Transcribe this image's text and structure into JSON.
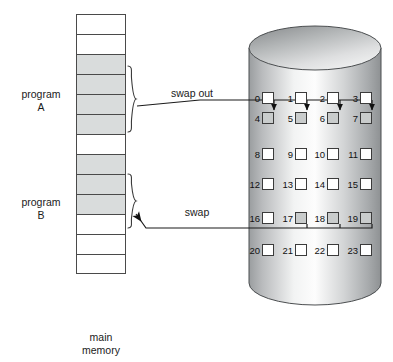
{
  "figure": {
    "title_alt": "swapping between main memory and disk",
    "main_memory_caption_line1": "main",
    "main_memory_caption_line2": "memory"
  },
  "labels": {
    "program_a_line1": "program",
    "program_a_line2": "A",
    "program_b_line1": "program",
    "program_b_line2": "B",
    "swap_out": "swap out",
    "swap_in": "swap"
  },
  "main_memory": {
    "row_count": 13,
    "rows": [
      {
        "index": 0,
        "state": "free"
      },
      {
        "index": 1,
        "state": "free"
      },
      {
        "index": 2,
        "state": "program-a"
      },
      {
        "index": 3,
        "state": "program-a"
      },
      {
        "index": 4,
        "state": "program-a"
      },
      {
        "index": 5,
        "state": "program-a"
      },
      {
        "index": 6,
        "state": "free"
      },
      {
        "index": 7,
        "state": "program-b"
      },
      {
        "index": 8,
        "state": "program-b"
      },
      {
        "index": 9,
        "state": "program-b"
      },
      {
        "index": 10,
        "state": "free"
      },
      {
        "index": 11,
        "state": "free"
      },
      {
        "index": 12,
        "state": "free"
      }
    ]
  },
  "disk": {
    "shape": "cylinder",
    "columns": 4,
    "rows": 6,
    "blocks": [
      {
        "id": 0,
        "label": "0",
        "occupied": false
      },
      {
        "id": 1,
        "label": "1",
        "occupied": false
      },
      {
        "id": 2,
        "label": "2",
        "occupied": false
      },
      {
        "id": 3,
        "label": "3",
        "occupied": false
      },
      {
        "id": 4,
        "label": "4",
        "occupied": true
      },
      {
        "id": 5,
        "label": "5",
        "occupied": true
      },
      {
        "id": 6,
        "label": "6",
        "occupied": true
      },
      {
        "id": 7,
        "label": "7",
        "occupied": true
      },
      {
        "id": 8,
        "label": "8",
        "occupied": false
      },
      {
        "id": 9,
        "label": "9",
        "occupied": false
      },
      {
        "id": 10,
        "label": "10",
        "occupied": false
      },
      {
        "id": 11,
        "label": "11",
        "occupied": false
      },
      {
        "id": 12,
        "label": "12",
        "occupied": false
      },
      {
        "id": 13,
        "label": "13",
        "occupied": false
      },
      {
        "id": 14,
        "label": "14",
        "occupied": false
      },
      {
        "id": 15,
        "label": "15",
        "occupied": false
      },
      {
        "id": 16,
        "label": "16",
        "occupied": false
      },
      {
        "id": 17,
        "label": "17",
        "occupied": true
      },
      {
        "id": 18,
        "label": "18",
        "occupied": true
      },
      {
        "id": 19,
        "label": "19",
        "occupied": true
      },
      {
        "id": 20,
        "label": "20",
        "occupied": false
      },
      {
        "id": 21,
        "label": "21",
        "occupied": false
      },
      {
        "id": 22,
        "label": "22",
        "occupied": false
      },
      {
        "id": 23,
        "label": "23",
        "occupied": false
      }
    ]
  },
  "colors": {
    "occupied_fill": "#d9dcdc",
    "free_fill": "#ffffff",
    "stroke": "#4a4a4a",
    "background": "#ffffff",
    "cylinder_light": "#fdfdfd",
    "cylinder_mid": "#c3c5c6",
    "cylinder_dark": "#8e9193"
  }
}
